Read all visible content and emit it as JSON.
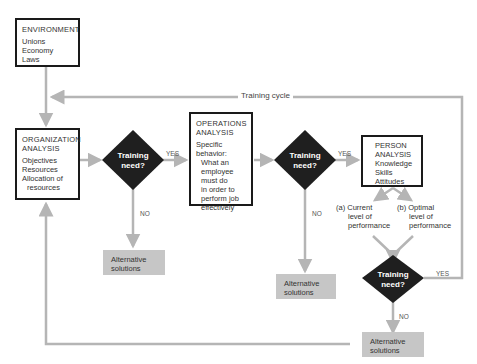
{
  "environment": {
    "title": "ENVIRONMENT",
    "items": [
      "Unions",
      "Economy",
      "Laws"
    ]
  },
  "organization": {
    "title1": "ORGANIZATION",
    "title2": "ANALYSIS",
    "items": [
      "Objectives",
      "Resources",
      "Allocation of",
      "resources"
    ]
  },
  "operations": {
    "title1": "OPERATIONS",
    "title2": "ANALYSIS",
    "items": [
      "Specific",
      "behavior:",
      "What an",
      "employee",
      "must do",
      "in order to",
      "perform job",
      "effectively"
    ]
  },
  "person": {
    "title1": "PERSON",
    "title2": "ANALYSIS",
    "items": [
      "Knowledge",
      "Skills",
      "Attitudes"
    ]
  },
  "decisions": {
    "d1": [
      "Training",
      "need?"
    ],
    "d2": [
      "Training",
      "need?"
    ],
    "d3": [
      "Training",
      "need?"
    ]
  },
  "labels": {
    "yes": "YES",
    "no": "NO",
    "training_cycle": "Training cycle"
  },
  "performance": {
    "a": [
      "(a) Current",
      "level of",
      "performance"
    ],
    "b": [
      "(b) Optimal",
      "level of",
      "performance"
    ]
  },
  "alternatives": {
    "line1": "Alternative",
    "line2": "solutions"
  },
  "colors": {
    "line": "#b5b5b5",
    "diamond": "#1f1f1f",
    "alt_box": "#c6c6c6",
    "box_border": "#1a1a1a"
  }
}
